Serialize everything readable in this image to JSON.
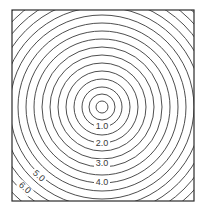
{
  "chart_data": {
    "type": "contour",
    "title": "",
    "xlabel": "",
    "ylabel": "",
    "frame": {
      "left": 12,
      "top": 10,
      "right": 194,
      "bottom": 201
    },
    "center": {
      "x": 102,
      "y": 107
    },
    "ring_radii_px": [
      6,
      13,
      20,
      28,
      36,
      44,
      52,
      60,
      68,
      76,
      84,
      92,
      100,
      108,
      116,
      124,
      132,
      140
    ],
    "contour_labels": [
      {
        "text": "1.0",
        "value": 1.0,
        "x": 102,
        "y": 129,
        "angle": 0
      },
      {
        "text": "2.0",
        "value": 2.0,
        "x": 102,
        "y": 146,
        "angle": 0
      },
      {
        "text": "3.0",
        "value": 3.0,
        "x": 102,
        "y": 166,
        "angle": 0
      },
      {
        "text": "4.0",
        "value": 4.0,
        "x": 102,
        "y": 185,
        "angle": 0
      },
      {
        "text": "5.0",
        "value": 5.0,
        "x": 37,
        "y": 178,
        "angle": 42
      },
      {
        "text": "6.0",
        "value": 6.0,
        "x": 23,
        "y": 190,
        "angle": 42
      }
    ],
    "line_color": "#3a3a3a",
    "frame_color": "#2a2a2a",
    "grid": false,
    "legend": "none"
  }
}
